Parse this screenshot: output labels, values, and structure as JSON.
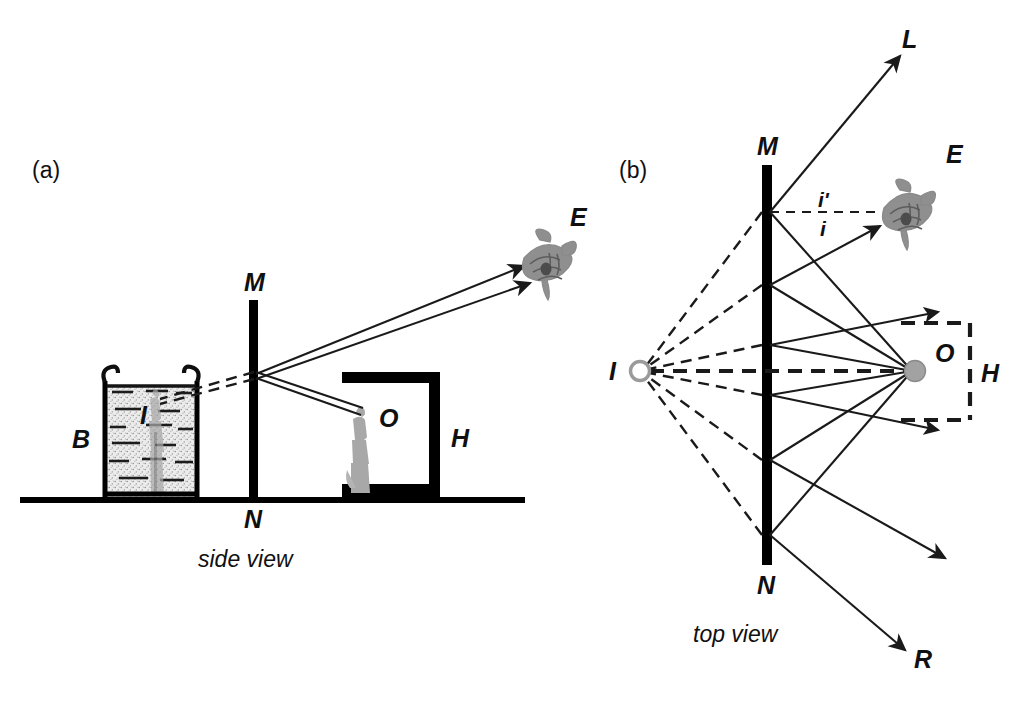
{
  "figure": {
    "kind": "physics-optics-diagram",
    "background": "#ffffff",
    "ink": "#101010",
    "gray_accent": "#a8a8a8"
  },
  "panels": [
    {
      "id": "a",
      "tag": "(a)",
      "caption": "side view",
      "labels": [
        {
          "key": "B",
          "text": "B",
          "meaning": "beaker"
        },
        {
          "key": "I",
          "text": "I",
          "meaning": "image of candle"
        },
        {
          "key": "M",
          "text": "M",
          "meaning": "mirror top"
        },
        {
          "key": "N",
          "text": "N",
          "meaning": "mirror bottom"
        },
        {
          "key": "O",
          "text": "O",
          "meaning": "object candle"
        },
        {
          "key": "H",
          "text": "H",
          "meaning": "housing / shield"
        },
        {
          "key": "E",
          "text": "E",
          "meaning": "eye"
        }
      ]
    },
    {
      "id": "b",
      "tag": "(b)",
      "caption": "top view",
      "labels": [
        {
          "key": "M",
          "text": "M",
          "meaning": "mirror top"
        },
        {
          "key": "N",
          "text": "N",
          "meaning": "mirror bottom"
        },
        {
          "key": "I",
          "text": "I",
          "meaning": "virtual image point"
        },
        {
          "key": "O",
          "text": "O",
          "meaning": "object point"
        },
        {
          "key": "H",
          "text": "H",
          "meaning": "housing width"
        },
        {
          "key": "E",
          "text": "E",
          "meaning": "eye"
        },
        {
          "key": "L",
          "text": "L",
          "meaning": "left limiting ray"
        },
        {
          "key": "R",
          "text": "R",
          "meaning": "right limiting ray"
        },
        {
          "key": "i-prime",
          "text": "i'",
          "meaning": "angle of reflection"
        },
        {
          "key": "i",
          "text": "i",
          "meaning": "angle of incidence"
        }
      ]
    }
  ],
  "annotations": {
    "panel_a_tag": "(a)",
    "panel_b_tag": "(b)",
    "caption_a": "side view",
    "caption_b": "top view",
    "a_B": "B",
    "a_I": "I",
    "a_M": "M",
    "a_N": "N",
    "a_O": "O",
    "a_H": "H",
    "a_E": "E",
    "b_M": "M",
    "b_N": "N",
    "b_I": "I",
    "b_O": "O",
    "b_H": "H",
    "b_E": "E",
    "b_L": "L",
    "b_R": "R",
    "b_i_prime": "i'",
    "b_i": "i"
  }
}
